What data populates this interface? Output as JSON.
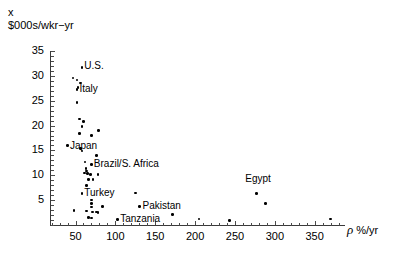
{
  "chart_data": {
    "type": "scatter",
    "title": "",
    "ylabel_lines": [
      "x",
      "$000s/wkr−yr"
    ],
    "xlabel": "ρ %/yr",
    "xlabel_symbol": "ρ",
    "xlabel_units": "%/yr",
    "grid": false,
    "legend": "none",
    "xlim": [
      18,
      388
    ],
    "ylim": [
      0,
      35
    ],
    "xticks": [
      50,
      100,
      150,
      200,
      250,
      300,
      350
    ],
    "yticks": [
      5,
      10,
      15,
      20,
      25,
      30,
      35
    ],
    "xtick_labels": [
      "50",
      "100",
      "150",
      "200",
      "250",
      "300",
      "350"
    ],
    "ytick_labels": [
      "5",
      "10",
      "15",
      "20",
      "25",
      "30",
      "35"
    ],
    "x_minor_step": 10,
    "y_minor_step": 1,
    "points": [
      {
        "x": 58,
        "y": 31.7,
        "label": "U.S."
      },
      {
        "x": 47,
        "y": 29.6,
        "label": ""
      },
      {
        "x": 52,
        "y": 29.2,
        "label": ""
      },
      {
        "x": 56,
        "y": 28.6,
        "label": ""
      },
      {
        "x": 52,
        "y": 27.2,
        "label": "Italy"
      },
      {
        "x": 53,
        "y": 27.6,
        "label": ""
      },
      {
        "x": 52,
        "y": 24.6,
        "label": ""
      },
      {
        "x": 55,
        "y": 21.3,
        "label": ""
      },
      {
        "x": 60,
        "y": 20.8,
        "label": ""
      },
      {
        "x": 58,
        "y": 19.8,
        "label": ""
      },
      {
        "x": 55,
        "y": 18.4,
        "label": ""
      },
      {
        "x": 70,
        "y": 18.0,
        "label": ""
      },
      {
        "x": 79,
        "y": 19.0,
        "label": ""
      },
      {
        "x": 40,
        "y": 16.0,
        "label": "Japan"
      },
      {
        "x": 56,
        "y": 15.4,
        "label": ""
      },
      {
        "x": 58,
        "y": 14.9,
        "label": ""
      },
      {
        "x": 76,
        "y": 14.0,
        "label": ""
      },
      {
        "x": 62,
        "y": 12.7,
        "label": ""
      },
      {
        "x": 70,
        "y": 12.2,
        "label": "Brazil/S. Africa"
      },
      {
        "x": 63,
        "y": 11.4,
        "label": ""
      },
      {
        "x": 64,
        "y": 10.9,
        "label": ""
      },
      {
        "x": 61,
        "y": 10.5,
        "label": ""
      },
      {
        "x": 65,
        "y": 10.3,
        "label": ""
      },
      {
        "x": 69,
        "y": 10.2,
        "label": ""
      },
      {
        "x": 78,
        "y": 10.1,
        "label": ""
      },
      {
        "x": 66,
        "y": 9.2,
        "label": ""
      },
      {
        "x": 72,
        "y": 9.1,
        "label": ""
      },
      {
        "x": 64,
        "y": 8.0,
        "label": ""
      },
      {
        "x": 58,
        "y": 6.3,
        "label": "Turkey"
      },
      {
        "x": 125,
        "y": 6.4,
        "label": ""
      },
      {
        "x": 70,
        "y": 5.0,
        "label": ""
      },
      {
        "x": 70,
        "y": 4.3,
        "label": ""
      },
      {
        "x": 70,
        "y": 3.6,
        "label": ""
      },
      {
        "x": 84,
        "y": 3.7,
        "label": ""
      },
      {
        "x": 130,
        "y": 3.7,
        "label": "Pakistan"
      },
      {
        "x": 48,
        "y": 2.9,
        "label": ""
      },
      {
        "x": 64,
        "y": 2.8,
        "label": ""
      },
      {
        "x": 71,
        "y": 2.6,
        "label": ""
      },
      {
        "x": 76,
        "y": 2.6,
        "label": ""
      },
      {
        "x": 78,
        "y": 2.5,
        "label": ""
      },
      {
        "x": 172,
        "y": 2.1,
        "label": ""
      },
      {
        "x": 66,
        "y": 1.5,
        "label": ""
      },
      {
        "x": 70,
        "y": 1.4,
        "label": ""
      },
      {
        "x": 103,
        "y": 1.1,
        "label": "Tanzania"
      },
      {
        "x": 277,
        "y": 6.3,
        "label": "Egypt"
      },
      {
        "x": 288,
        "y": 4.3,
        "label": ""
      },
      {
        "x": 205,
        "y": 1.2,
        "label": ""
      },
      {
        "x": 243,
        "y": 0.9,
        "label": ""
      },
      {
        "x": 370,
        "y": 1.2,
        "label": ""
      }
    ],
    "annotations": [
      {
        "text": "U.S.",
        "x": 61,
        "y": 31.7,
        "anchor": "left"
      },
      {
        "text": "Italy",
        "x": 55,
        "y": 27.2,
        "anchor": "left"
      },
      {
        "text": "Japan",
        "x": 43,
        "y": 15.7,
        "anchor": "left"
      },
      {
        "text": "Brazil/S. Africa",
        "x": 73,
        "y": 12.0,
        "anchor": "left"
      },
      {
        "text": "Turkey",
        "x": 61,
        "y": 6.2,
        "anchor": "left"
      },
      {
        "text": "Pakistan",
        "x": 134,
        "y": 3.6,
        "anchor": "left"
      },
      {
        "text": "Tanzania",
        "x": 106,
        "y": 1.1,
        "anchor": "left"
      },
      {
        "text": "Egypt",
        "x": 263,
        "y": 9.1,
        "anchor": "left"
      }
    ],
    "marker": {
      "color": "#000000",
      "shape": "circle",
      "size_px": 2.6
    },
    "axis_color": "#3a3a3a"
  }
}
